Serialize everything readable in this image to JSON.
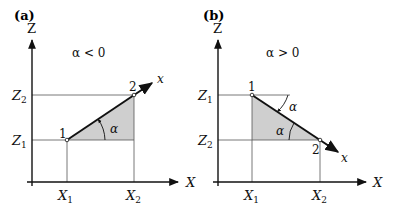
{
  "panels": [
    {
      "id": "a",
      "label": "(a)",
      "condition": "α < 0",
      "z_axis_label": "Z",
      "x_axis_label": "X",
      "z_ticks": [
        "Z",
        "Z"
      ],
      "z_tick_subs": [
        "2",
        "1"
      ],
      "x_ticks": [
        "X",
        "X"
      ],
      "x_tick_subs": [
        "1",
        "2"
      ],
      "point_1": "1",
      "point_2": "2",
      "local_axis": "x",
      "angle": "α"
    },
    {
      "id": "b",
      "label": "(b)",
      "condition": "α > 0",
      "z_axis_label": "Z",
      "x_axis_label": "X",
      "z_ticks": [
        "Z",
        "Z"
      ],
      "z_tick_subs": [
        "1",
        "2"
      ],
      "x_ticks": [
        "X",
        "X"
      ],
      "x_tick_subs": [
        "1",
        "2"
      ],
      "point_1": "1",
      "point_2": "2",
      "local_axis": "x",
      "angle": "α",
      "angle_2": "α"
    }
  ],
  "colors": {
    "shade": "#cfcfcf",
    "line": "#111111",
    "thin": "#555555"
  }
}
